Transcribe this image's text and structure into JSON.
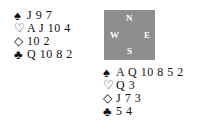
{
  "hands": {
    "west": {
      "spades": "J 9 7",
      "hearts": "A J 10 4",
      "diamonds": "10 2",
      "clubs": "Q 10 8 2"
    },
    "south": {
      "spades": "A Q 10 8 5 2",
      "hearts": "Q 3",
      "diamonds": "J 7 3",
      "clubs": "5 4"
    }
  },
  "suit_symbols": {
    "spades": "♠",
    "hearts": "♡",
    "diamonds": "◇",
    "clubs": "♣"
  },
  "compass": {
    "north": "N",
    "south": "S",
    "east": "E",
    "west": "W",
    "background": "#8e8e8e"
  }
}
